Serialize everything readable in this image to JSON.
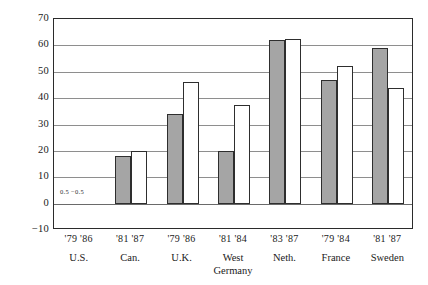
{
  "chart_data": {
    "type": "bar",
    "title": "",
    "xlabel": "",
    "ylabel": "",
    "ylim": [
      -10,
      70
    ],
    "yticks": [
      70,
      60,
      50,
      40,
      30,
      20,
      10,
      0,
      -10
    ],
    "grid": true,
    "legend_position": "none",
    "categories": [
      "U.S.",
      "Can.",
      "U.K.",
      "West Germany",
      "Neth.",
      "France",
      "Sweden"
    ],
    "category_years": [
      [
        "'79",
        "'86"
      ],
      [
        "'81",
        "'87"
      ],
      [
        "'79",
        "'86"
      ],
      [
        "'81",
        "'84"
      ],
      [
        "'83",
        "'87"
      ],
      [
        "'79",
        "'84"
      ],
      [
        "'81",
        "'87"
      ]
    ],
    "series": [
      {
        "name": "earlier year",
        "style": "gray",
        "values": [
          0.5,
          18,
          34,
          20,
          62,
          47,
          59
        ]
      },
      {
        "name": "later year",
        "style": "white",
        "values": [
          -0.5,
          20,
          46,
          37.5,
          62.5,
          52,
          44
        ]
      }
    ],
    "annotations": [
      {
        "category": "U.S.",
        "text": "0.5  −0.5",
        "x_px": 60,
        "y_value": 3
      }
    ],
    "colors": {
      "gray_bar": "#a5a5a5",
      "white_bar": "#ffffff",
      "bar_outline": "#2e2e2e",
      "gridline": "#8e8e8e",
      "frame": "#2b2b2b",
      "text": "#1a1a1a",
      "background": "#ffffff"
    }
  },
  "axis": {
    "y_labels": [
      "70",
      "60",
      "50",
      "40",
      "30",
      "20",
      "10",
      "0",
      "−10"
    ]
  },
  "groups": [
    {
      "years": "'79 '86",
      "name": "U.S.",
      "name2": ""
    },
    {
      "years": "'81 '87",
      "name": "Can.",
      "name2": ""
    },
    {
      "years": "'79 '86",
      "name": "U.K.",
      "name2": ""
    },
    {
      "years": "'81 '84",
      "name": "West",
      "name2": "Germany"
    },
    {
      "years": "'83 '87",
      "name": "Neth.",
      "name2": ""
    },
    {
      "years": "'79 '84",
      "name": "France",
      "name2": ""
    },
    {
      "years": "'81 '87",
      "name": "Sweden",
      "name2": ""
    }
  ],
  "micro": {
    "label": "0.5  −0.5"
  }
}
